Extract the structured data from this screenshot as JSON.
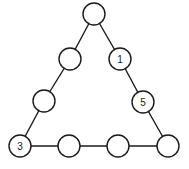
{
  "diagram": {
    "type": "magic-triangle-puzzle",
    "stroke_color": "#1a1a1a",
    "background": "#ffffff",
    "node_radius": 11,
    "nodes": [
      {
        "id": "top",
        "x": 94,
        "y": 14,
        "label": ""
      },
      {
        "id": "left-upper",
        "x": 70,
        "y": 59,
        "label": ""
      },
      {
        "id": "right-upper",
        "x": 120,
        "y": 59,
        "label": "1"
      },
      {
        "id": "left-middle",
        "x": 44,
        "y": 101,
        "label": ""
      },
      {
        "id": "right-middle",
        "x": 143,
        "y": 102,
        "label": "5"
      },
      {
        "id": "bottom-left",
        "x": 20,
        "y": 146,
        "label": "3"
      },
      {
        "id": "bottom-mid-1",
        "x": 69,
        "y": 146,
        "label": ""
      },
      {
        "id": "bottom-mid-2",
        "x": 118,
        "y": 146,
        "label": ""
      },
      {
        "id": "bottom-right",
        "x": 168,
        "y": 146,
        "label": ""
      }
    ],
    "edges": [
      [
        "top",
        "left-upper"
      ],
      [
        "left-upper",
        "left-middle"
      ],
      [
        "left-middle",
        "bottom-left"
      ],
      [
        "top",
        "right-upper"
      ],
      [
        "right-upper",
        "right-middle"
      ],
      [
        "right-middle",
        "bottom-right"
      ],
      [
        "bottom-left",
        "bottom-mid-1"
      ],
      [
        "bottom-mid-1",
        "bottom-mid-2"
      ],
      [
        "bottom-mid-2",
        "bottom-right"
      ]
    ]
  }
}
